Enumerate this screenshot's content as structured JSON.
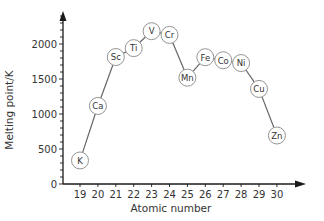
{
  "chart_data": {
    "type": "line",
    "title": "",
    "xlabel": "Atomic number",
    "ylabel": "Melting point/K",
    "x": [
      19,
      20,
      21,
      22,
      23,
      24,
      25,
      26,
      27,
      28,
      29,
      30
    ],
    "categories": [
      "19",
      "20",
      "21",
      "22",
      "23",
      "24",
      "25",
      "26",
      "27",
      "28",
      "29",
      "30"
    ],
    "labels": [
      "K",
      "Ca",
      "Sc",
      "Ti",
      "V",
      "Cr",
      "Mn",
      "Fe",
      "Co",
      "Ni",
      "Cu",
      "Zn"
    ],
    "values": [
      336,
      1115,
      1814,
      1941,
      2183,
      2130,
      1519,
      1811,
      1768,
      1728,
      1358,
      693
    ],
    "series": [
      {
        "name": "Melting point",
        "values": [
          336,
          1115,
          1814,
          1941,
          2183,
          2130,
          1519,
          1811,
          1768,
          1728,
          1358,
          693
        ]
      }
    ],
    "yticks": [
      0,
      500,
      1000,
      1500,
      2000
    ],
    "xticks": [
      19,
      20,
      21,
      22,
      23,
      24,
      25,
      26,
      27,
      28,
      29,
      30
    ],
    "xlim": [
      18,
      31
    ],
    "ylim": [
      0,
      2450
    ],
    "grid": false,
    "legend": "none",
    "marker": "circle-with-element-symbol"
  },
  "axes": {
    "xlabel": "Atomic number",
    "ylabel": "Melting point/K"
  },
  "colors": {
    "axis": "#1a1a1a",
    "line": "#666666",
    "marker_stroke": "#888888",
    "text": "#333333"
  }
}
